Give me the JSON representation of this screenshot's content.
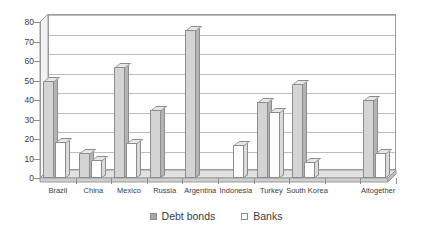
{
  "chart_data": {
    "type": "bar",
    "title": "",
    "subtitle": "",
    "xlabel": "",
    "ylabel": "",
    "ylim": [
      0,
      80
    ],
    "ytick_step": 10,
    "ytick_labels": [
      "0",
      "10",
      "20",
      "30",
      "40",
      "50",
      "60",
      "70",
      "80"
    ],
    "grid": true,
    "legend_position": "bottom-center",
    "style": "3d-clustered-column",
    "categories": [
      "Brazil",
      "China",
      "Mexico",
      "Russia",
      "Argentina",
      "Indonesia",
      "Turkey",
      "South Korea",
      "",
      "Altogether"
    ],
    "series": [
      {
        "name": "Debt bonds",
        "color": "#d4d4d4",
        "values": [
          50,
          13,
          57,
          35,
          76,
          0,
          39,
          48,
          0,
          40
        ]
      },
      {
        "name": "Banks",
        "color": "#ffffff",
        "values": [
          18.5,
          9,
          18,
          0,
          0,
          17,
          34,
          8,
          0,
          13
        ]
      }
    ]
  },
  "legend": {
    "items": [
      {
        "label": "Debt bonds",
        "swatch": "filled-gray-square"
      },
      {
        "label": "Banks",
        "swatch": "empty-white-square"
      }
    ]
  }
}
